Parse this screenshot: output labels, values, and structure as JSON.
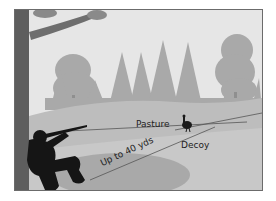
{
  "figure": {
    "labels": {
      "pasture": "Pasture",
      "decoy": "Decoy",
      "range": "Up to 40 yds"
    },
    "colors": {
      "sky": "#e4e4e4",
      "trees": "#a9a9a9",
      "tree_dark": "#9a9a9a",
      "ground_far": "#bdbdbd",
      "ground_near": "#c6c6c6",
      "shadow": "#a8a8a8",
      "trunk": "#5e5e5e",
      "silhouette": "#151515",
      "lines": "#555555",
      "border": "#6b6b6b"
    }
  }
}
